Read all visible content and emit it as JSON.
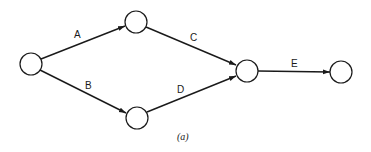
{
  "diagram": {
    "type": "activity-on-arrow network",
    "caption": "(a)",
    "nodes": [
      {
        "id": "n1",
        "cx": 31,
        "cy": 64,
        "r": 11
      },
      {
        "id": "n2",
        "cx": 136,
        "cy": 22,
        "r": 11
      },
      {
        "id": "n3",
        "cx": 137,
        "cy": 118,
        "r": 11
      },
      {
        "id": "n4",
        "cx": 247,
        "cy": 71,
        "r": 11
      },
      {
        "id": "n5",
        "cx": 341,
        "cy": 72,
        "r": 11
      }
    ],
    "edges": [
      {
        "from": "n1",
        "to": "n2",
        "label": "A"
      },
      {
        "from": "n1",
        "to": "n3",
        "label": "B"
      },
      {
        "from": "n2",
        "to": "n4",
        "label": "C"
      },
      {
        "from": "n3",
        "to": "n4",
        "label": "D"
      },
      {
        "from": "n4",
        "to": "n5",
        "label": "E"
      }
    ],
    "labels": {
      "A": "A",
      "B": "B",
      "C": "C",
      "D": "D",
      "E": "E"
    }
  }
}
